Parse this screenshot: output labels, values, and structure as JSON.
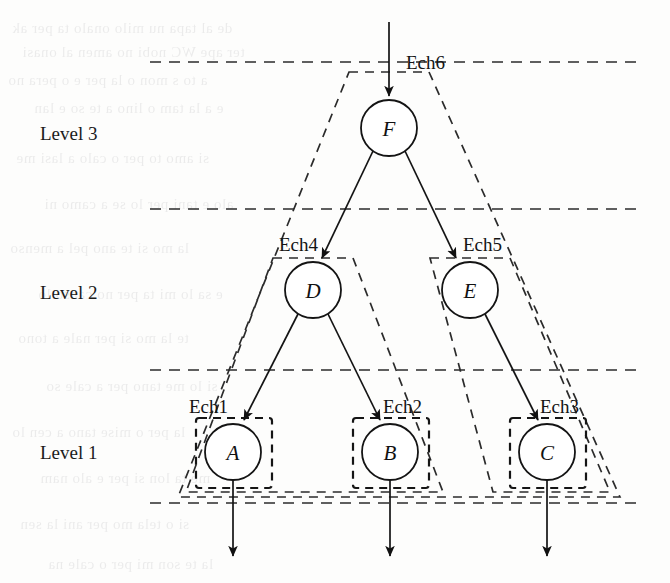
{
  "figure": {
    "type": "hierarchical-tree-diagram",
    "background": "#fdfdfc",
    "ink_color": "#111111"
  },
  "levels": [
    {
      "id": "level3",
      "label": "Level 3",
      "x": 40,
      "y": 133
    },
    {
      "id": "level2",
      "label": "Level 2",
      "x": 40,
      "y": 292
    },
    {
      "id": "level1",
      "label": "Level 1",
      "x": 40,
      "y": 452
    }
  ],
  "separators": [
    {
      "id": "sep-top",
      "y": 62,
      "x1": 150,
      "x2": 642
    },
    {
      "id": "sep-3-2",
      "y": 209,
      "x1": 150,
      "x2": 642
    },
    {
      "id": "sep-2-1",
      "y": 370,
      "x1": 150,
      "x2": 642
    },
    {
      "id": "sep-bottom",
      "y": 503,
      "x1": 150,
      "x2": 642
    }
  ],
  "nodes": [
    {
      "id": "F",
      "label": "F",
      "cx": 389,
      "cy": 128,
      "r": 28,
      "level": "level3"
    },
    {
      "id": "D",
      "label": "D",
      "cx": 313,
      "cy": 290,
      "r": 28,
      "level": "level2"
    },
    {
      "id": "E",
      "label": "E",
      "cx": 470,
      "cy": 290,
      "r": 28,
      "level": "level2"
    },
    {
      "id": "A",
      "label": "A",
      "cx": 233,
      "cy": 452,
      "r": 28,
      "level": "level1"
    },
    {
      "id": "B",
      "label": "B",
      "cx": 390,
      "cy": 452,
      "r": 28,
      "level": "level1"
    },
    {
      "id": "C",
      "label": "C",
      "cx": 547,
      "cy": 452,
      "r": 28,
      "level": "level1"
    }
  ],
  "edges": [
    {
      "id": "edge-in-F",
      "from": "input",
      "to": "F",
      "arrow": true
    },
    {
      "id": "edge-F-D",
      "from": "F",
      "to": "D",
      "arrow": true
    },
    {
      "id": "edge-F-E",
      "from": "F",
      "to": "E",
      "arrow": true
    },
    {
      "id": "edge-D-A",
      "from": "D",
      "to": "A",
      "arrow": true
    },
    {
      "id": "edge-D-B",
      "from": "D",
      "to": "B",
      "arrow": true
    },
    {
      "id": "edge-E-C",
      "from": "E",
      "to": "C",
      "arrow": true
    },
    {
      "id": "edge-A-out",
      "from": "A",
      "to": "output",
      "arrow": true
    },
    {
      "id": "edge-B-out",
      "from": "B",
      "to": "output",
      "arrow": true
    },
    {
      "id": "edge-C-out",
      "from": "C",
      "to": "output",
      "arrow": true
    }
  ],
  "scopes": [
    {
      "id": "ech1",
      "label": "Ech1",
      "label_x": 189,
      "label_y": 408,
      "encloses": [
        "A"
      ]
    },
    {
      "id": "ech2",
      "label": "Ech2",
      "label_x": 383,
      "label_y": 408,
      "encloses": [
        "B"
      ]
    },
    {
      "id": "ech3",
      "label": "Ech3",
      "label_x": 540,
      "label_y": 408,
      "encloses": [
        "C"
      ]
    },
    {
      "id": "ech4",
      "label": "Ech4",
      "label_x": 279,
      "label_y": 246,
      "encloses": [
        "D",
        "Ech1",
        "Ech2"
      ]
    },
    {
      "id": "ech5",
      "label": "Ech5",
      "label_x": 463,
      "label_y": 246,
      "encloses": [
        "E",
        "Ech3"
      ]
    },
    {
      "id": "ech6",
      "label": "Ech6",
      "label_x": 406,
      "label_y": 62,
      "encloses": [
        "F",
        "Ech4",
        "Ech5"
      ]
    }
  ],
  "bleed_through_lines": [
    {
      "text": "de al tapa nu milo onalo ta per ak",
      "x": 12,
      "y": 20
    },
    {
      "text": "ter ape WC nobi no amen al onasi",
      "x": 22,
      "y": 44
    },
    {
      "text": "a to s mon o la per e o pera no",
      "x": 8,
      "y": 72
    },
    {
      "text": "e a la tam o lino a te so e lan",
      "x": 34,
      "y": 100
    },
    {
      "text": "si amo to per o calo a lasi me",
      "x": 16,
      "y": 150
    },
    {
      "text": "alo e tani per lo se a camo ni",
      "x": 44,
      "y": 196
    },
    {
      "text": "la mo si te ano pel a menso",
      "x": 10,
      "y": 240
    },
    {
      "text": "e sa lo mi ta per no canso lo",
      "x": 38,
      "y": 286
    },
    {
      "text": "te la mo si per nale a tono",
      "x": 18,
      "y": 330
    },
    {
      "text": "si lo me tano per a cale so",
      "x": 46,
      "y": 378
    },
    {
      "text": "la per o mise tano a cen lo",
      "x": 12,
      "y": 424
    },
    {
      "text": "me ta lon si per e alo nam",
      "x": 40,
      "y": 470
    },
    {
      "text": "si o tela mo per ani la sen",
      "x": 20,
      "y": 516
    },
    {
      "text": "la te son mi per o cale na",
      "x": 48,
      "y": 556
    }
  ]
}
